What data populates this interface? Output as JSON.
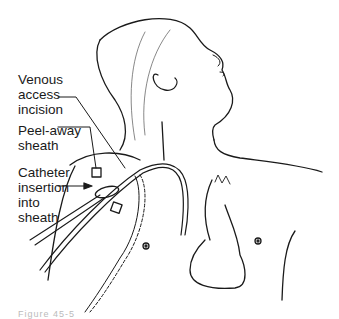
{
  "figure": {
    "labels": [
      {
        "id": "venous",
        "text": "Venous\naccess\nincision"
      },
      {
        "id": "sheath",
        "text": "Peel-away\nsheath"
      },
      {
        "id": "catheter",
        "text": "Catheter\ninsertion\ninto\nsheath"
      }
    ],
    "caption": "Figure 45-5",
    "line_color": "#1a1a1a"
  }
}
